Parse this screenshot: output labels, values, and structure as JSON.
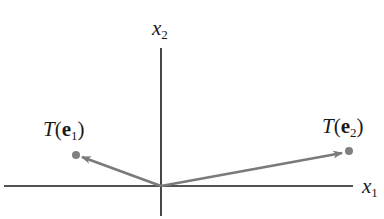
{
  "diagram": {
    "type": "vector-transformation",
    "axes": {
      "horizontal": {
        "var": "x",
        "sub": "1"
      },
      "vertical": {
        "var": "x",
        "sub": "2"
      }
    },
    "vectors": [
      {
        "name": "T(e1)",
        "func": "T",
        "vec": "e",
        "sub": "1",
        "direction": "up-left"
      },
      {
        "name": "T(e2)",
        "func": "T",
        "vec": "e",
        "sub": "2",
        "direction": "up-right"
      }
    ],
    "colors": {
      "axis": "#1a1a1a",
      "vector": "#7a7a7a",
      "point": "#808080",
      "text": "#1a1a1a"
    }
  }
}
